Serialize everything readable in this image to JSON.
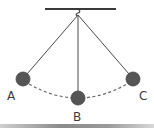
{
  "diagram": {
    "labels": {
      "a": "A",
      "b": "B",
      "c": "C"
    },
    "colors": {
      "bob": "#555555",
      "string": "#4a4a4a",
      "support": "#3a3a3a",
      "arc": "#666666",
      "label": "#3a3a3a"
    }
  }
}
